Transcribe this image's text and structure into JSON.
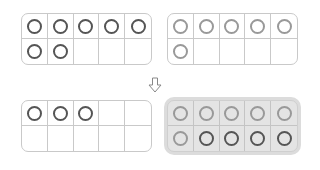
{
  "frames": [
    {
      "id": "top-left",
      "counters": 7,
      "style": "dark",
      "cells": [
        "dark",
        "dark",
        "dark",
        "dark",
        "dark",
        "dark",
        "dark",
        "",
        "",
        ""
      ]
    },
    {
      "id": "top-right",
      "counters": 6,
      "style": "light",
      "cells": [
        "light",
        "light",
        "light",
        "light",
        "light",
        "light",
        "",
        "",
        "",
        ""
      ]
    },
    {
      "id": "bottom-left",
      "counters": 3,
      "style": "dark",
      "cells": [
        "dark",
        "dark",
        "dark",
        "",
        "",
        "",
        "",
        "",
        "",
        ""
      ]
    },
    {
      "id": "bottom-right",
      "counters": 10,
      "highlighted": true,
      "cells": [
        "light",
        "light",
        "light",
        "light",
        "light",
        "light",
        "dark",
        "dark",
        "dark",
        "dark"
      ]
    }
  ],
  "arrow": {
    "icon": "down-arrow-icon",
    "direction": "down"
  },
  "colors": {
    "frame_border": "#c9c9c9",
    "counter_dark": "#5f5f5f",
    "counter_light": "#999999",
    "highlight_bg": "#e4e4e4"
  }
}
